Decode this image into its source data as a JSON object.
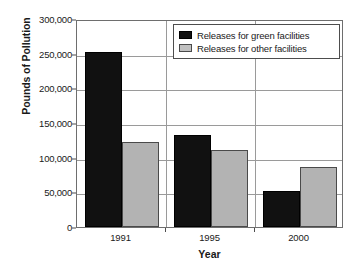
{
  "chart_data": {
    "type": "bar",
    "title": "",
    "xlabel": "Year",
    "ylabel": "Pounds of Pollution",
    "categories": [
      "1991",
      "1995",
      "2000"
    ],
    "series": [
      {
        "name": "Releases for green facilities",
        "color": "#111111",
        "values": [
          252000,
          132000,
          52000
        ]
      },
      {
        "name": "Releases for other facilities",
        "color": "#b3b3b3",
        "values": [
          122000,
          111000,
          87000
        ]
      }
    ],
    "ylim": [
      0,
      300000
    ],
    "ytick_step": 50000,
    "ytick_labels": [
      "0",
      "50,000",
      "100,000",
      "150,000",
      "200,000",
      "250,000",
      "300,000"
    ],
    "ytick_values": [
      0,
      50000,
      100000,
      150000,
      200000,
      250000,
      300000
    ],
    "grid": "horizontal-and-category-separators",
    "legend_position": "top-right-inside"
  },
  "legend": {
    "items": [
      {
        "label": "Releases for green facilities"
      },
      {
        "label": "Releases for other facilities"
      }
    ]
  },
  "axes": {
    "y_title": "Pounds of Pollution",
    "x_title": "Year"
  }
}
